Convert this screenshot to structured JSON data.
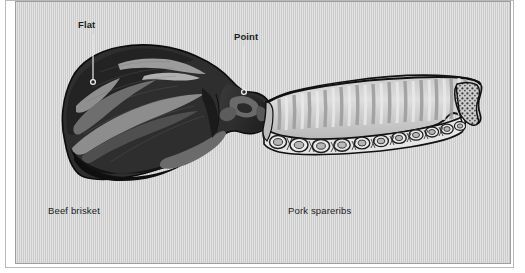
{
  "figure": {
    "background_color": "#d0d0d0",
    "frame_color": "#9e9e9e",
    "page_color": "#ffffff"
  },
  "callouts": [
    {
      "id": "flat",
      "label": "Flat",
      "target": "beef-brisket-flat-region"
    },
    {
      "id": "point",
      "label": "Point",
      "target": "beef-brisket-point-region"
    }
  ],
  "specimens": [
    {
      "id": "beef-brisket",
      "caption": "Beef brisket",
      "colors": {
        "outline": "#111111",
        "dark_meat": "#2b2b2b",
        "mid_meat": "#4a4a4a",
        "fat_light": "#9a9a9a",
        "fat_highlight": "#b8b8b8"
      }
    },
    {
      "id": "pork-spareribs",
      "caption": "Pork spareribs",
      "colors": {
        "outline": "#111111",
        "meat_light": "#d5d5d5",
        "meat_shadow": "#a9a9a9",
        "bone_fill": "#e4e4e4",
        "bone_outline": "#2a2a2a",
        "cartilage": "#bdbdbd"
      },
      "rib_bone_count": 13
    }
  ]
}
